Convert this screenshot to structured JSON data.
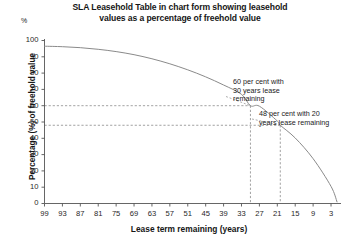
{
  "chart_data": {
    "type": "line",
    "title": "SLA Leasehold Table in chart form showing leasehold values as a percentage of freehold value",
    "title_line1": "SLA Leasehold Table in chart form showing leasehold",
    "title_line2": "values as a percentage of freehold value",
    "xlabel": "Lease term remaining (years)",
    "ylabel": "Percentage (%) of freehold value",
    "y_unit_symbol": "%",
    "xlim": [
      99,
      1
    ],
    "ylim": [
      0,
      100
    ],
    "x_inverted": true,
    "grid": false,
    "legend": "none",
    "line_color": "#8a8a8a",
    "guide_color": "#8a8a8a",
    "axis_color": "#555555",
    "x_ticks": [
      99,
      93,
      87,
      81,
      75,
      69,
      63,
      57,
      51,
      45,
      39,
      33,
      27,
      21,
      15,
      9,
      3
    ],
    "y_ticks": [
      0,
      10,
      20,
      30,
      40,
      50,
      60,
      70,
      80,
      90,
      100
    ],
    "x": [
      99,
      93,
      87,
      81,
      75,
      69,
      63,
      57,
      51,
      45,
      39,
      33,
      30,
      27,
      21,
      20,
      15,
      9,
      3,
      1
    ],
    "values": [
      96.5,
      96.2,
      95.6,
      94.6,
      93.2,
      91.3,
      88.8,
      85.7,
      82.0,
      77.7,
      72.7,
      67.0,
      60.0,
      59.7,
      50.6,
      48.0,
      40.2,
      27.5,
      10.5,
      1.0
    ],
    "series": [
      {
        "name": "Leasehold value as percentage of freehold value",
        "x": [
          99,
          93,
          87,
          81,
          75,
          69,
          63,
          57,
          51,
          45,
          39,
          33,
          30,
          27,
          21,
          20,
          15,
          9,
          3,
          1
        ],
        "values": [
          96.5,
          96.2,
          95.6,
          94.6,
          93.2,
          91.3,
          88.8,
          85.7,
          82.0,
          77.7,
          72.7,
          67.0,
          60.0,
          59.7,
          50.6,
          48.0,
          40.2,
          27.5,
          10.5,
          1.0
        ]
      }
    ],
    "annotations": [
      {
        "id": "annotation-60",
        "text": "60 per cent with 30 years lease remaining",
        "line1": "60 per cent with",
        "line2": "30 years lease",
        "line3": "remaining",
        "point_x": 30,
        "point_y": 60
      },
      {
        "id": "annotation-48",
        "text": "48 per cent with 20 years lease remaining",
        "line1": "48 per cent with 20",
        "line2": "years lease remaining",
        "point_x": 20,
        "point_y": 48
      }
    ],
    "guide_lines": [
      {
        "y": 60,
        "x": 30
      },
      {
        "y": 48,
        "x": 20
      }
    ]
  }
}
